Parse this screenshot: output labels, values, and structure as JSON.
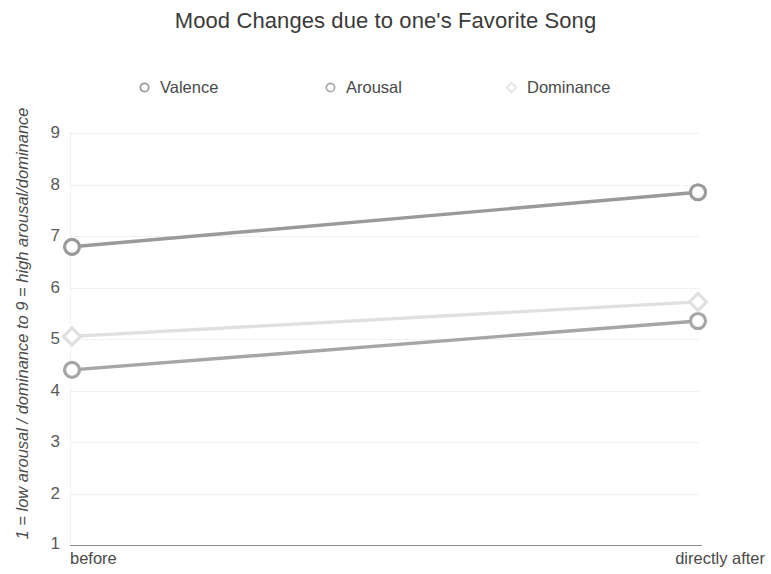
{
  "chart_data": {
    "type": "line",
    "title": "Mood Changes due to one's Favorite Song",
    "xlabel": "",
    "ylabel": "1 = low arousal / dominance to 9 = high arousal/dominance",
    "categories": [
      "before",
      "directly after"
    ],
    "x_tick_labels": [
      "before",
      "directly after"
    ],
    "y_tick_labels": [
      "1",
      "2",
      "3",
      "4",
      "5",
      "6",
      "7",
      "8",
      "9"
    ],
    "ylim": [
      1,
      9
    ],
    "grid": true,
    "grid_axis": "y",
    "legend_position": "top",
    "marker": "circle-open",
    "series": [
      {
        "name": "Valence",
        "values": [
          6.79,
          7.85
        ],
        "color": "#9a9a9a",
        "marker": "circle-open"
      },
      {
        "name": "Arousal",
        "values": [
          4.4,
          5.35
        ],
        "color": "#a6a6a6",
        "marker": "circle-open"
      },
      {
        "name": "Dominance",
        "values": [
          5.05,
          5.72
        ],
        "color": "#e0e0e0",
        "marker": "diamond-open"
      }
    ]
  },
  "title": {
    "text": "Mood Changes due to one's Favorite Song"
  },
  "legend": {
    "items": [
      {
        "label": "Valence",
        "marker_name": "valence-legend-marker-icon",
        "color": "#9a9a9a"
      },
      {
        "label": "Arousal",
        "marker_name": "arousal-legend-marker-icon",
        "color": "#a6a6a6"
      },
      {
        "label": "Dominance",
        "marker_name": "dominance-legend-marker-icon",
        "color": "#e0e0e0"
      }
    ]
  },
  "axes": {
    "y_title": "1 = low arousal / dominance to 9 = high arousal/dominance",
    "y_ticks": [
      "9",
      "8",
      "7",
      "6",
      "5",
      "4",
      "3",
      "2",
      "1"
    ],
    "x_ticks": [
      "before",
      "directly after"
    ]
  },
  "colors": {
    "title": "#3a3a3a",
    "tick_label": "#5a5a5a",
    "axis_line": "#8e8e8e",
    "grid_line": "#e3e3e3",
    "valence": "#9a9a9a",
    "arousal": "#a6a6a6",
    "dominance": "#e0e0e0"
  }
}
